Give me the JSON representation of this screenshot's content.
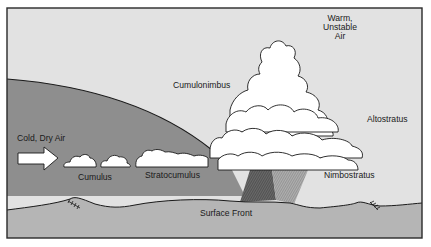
{
  "diagram": {
    "colors": {
      "sky_warm": "#e2e2e2",
      "cold_air_mass": "#8e8e8e",
      "ground": "#b5b5b5",
      "cloud_fill": "#ffffff",
      "outline": "#1a1a1a",
      "rain_dark": "#5a5a5a",
      "rain_light": "#9a9a9a"
    },
    "labels": {
      "warm_air": [
        "Warm,",
        "Unstable",
        "Air"
      ],
      "cumulonimbus": "Cumulonimbus",
      "altostratus": "Altostratus",
      "cold_dry_air": "Cold, Dry Air",
      "cumulus": "Cumulus",
      "stratocumulus": "Stratocumulus",
      "nimbostratus": "Nimbostratus",
      "surface_front": "Surface Front"
    },
    "icons": {
      "arrow": "wind-arrow-icon",
      "front_symbol_left": "front-hatch-icon",
      "front_symbol_right": "front-hatch-icon"
    }
  }
}
